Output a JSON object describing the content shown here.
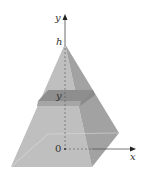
{
  "figure": {
    "labels": {
      "y_axis": "y",
      "x_axis": "x",
      "apex": "h",
      "cross_section": "y",
      "origin": "0"
    },
    "colors": {
      "front_face": "#bdbdbd",
      "left_face": "#c9c9c9",
      "right_face": "#9e9e9e",
      "slab_top": "#8f8f8f",
      "slab_front": "#a9a9a9",
      "axis": "#444444"
    }
  }
}
